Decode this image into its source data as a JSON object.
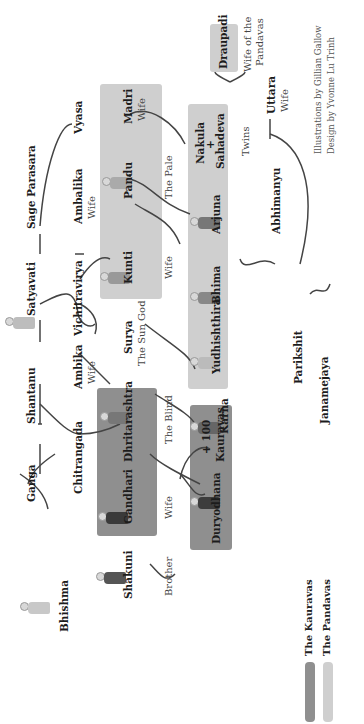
{
  "people": {
    "bhishma": "Bhishma",
    "ganga": "Ganga",
    "shantanu": "Shantanu",
    "satyavati": "Satyavati",
    "sage_parasara": "Sage Parasara",
    "vyasa": "Vyasa",
    "chitrangada": "Chitrangada",
    "vichitravirya": "Vichitravirya",
    "ambika": "Ambika",
    "ambalika": "Ambalika",
    "shakuni": "Shakuni",
    "gandhari": "Gandhari",
    "dhritarashtra": "Dhritarashtra",
    "surya": "Surya",
    "kunti": "Kunti",
    "pandu": "Pandu",
    "madri": "Madri",
    "duryodhana": "Duryodhana",
    "hundred_kauravas_line1": "+ 100",
    "hundred_kauravas_line2": "Kauravas",
    "karna": "Karna",
    "yudhishthira": "Yudhishthira",
    "bhima": "Bhima",
    "arjuna": "Arjuna",
    "nakula": "Nakula",
    "plus": "+",
    "sahadeva": "Sahadeva",
    "draupadi": "Draupadi",
    "abhimanyu": "Abhimanyu",
    "uttara": "Uttara",
    "parikshit": "Parikshit",
    "janamejaya": "Janamejaya"
  },
  "descriptors": {
    "ambika": "Wife",
    "ambalika": "Wife",
    "shakuni": "Brother",
    "gandhari": "Wife",
    "dhritarashtra": "The Blind",
    "surya": "The Sun God",
    "kunti": "Wife",
    "pandu": "The Pale",
    "madri": "Wife",
    "twins": "Twins",
    "draupadi_line1": "Wife of the",
    "draupadi_line2": "Pandavas",
    "uttara": "Wife"
  },
  "legend": {
    "kauravas": "The Kauravas",
    "pandavas": "The Pandavas",
    "kauravas_color": "#8f8f8f",
    "pandavas_color": "#cfcfcf"
  },
  "credits": {
    "line1": "Illustrations by Gillian Gallow",
    "line2": "Design by Yvonne Lu Trinh"
  }
}
